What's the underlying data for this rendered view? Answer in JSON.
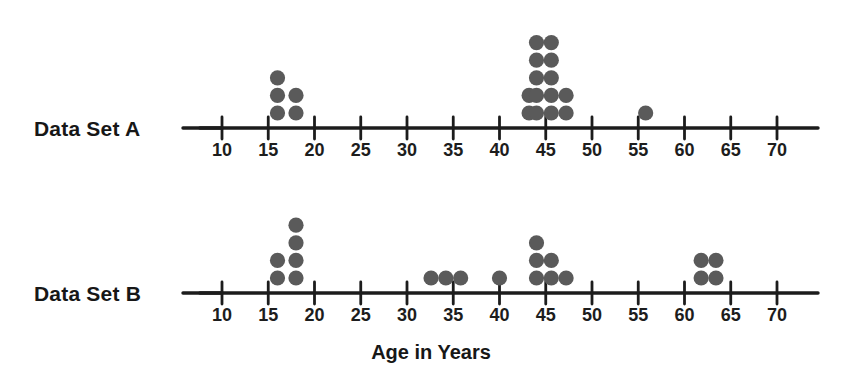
{
  "figure": {
    "axis_title": "Age in Years",
    "dot_color": "#5a5a5a",
    "axis_color": "#1c1c1c"
  },
  "plots": [
    {
      "id": "data-set-a",
      "label": "Data Set A",
      "baseline_y": 128,
      "ticks": [
        10,
        15,
        20,
        25,
        30,
        35,
        40,
        45,
        50,
        55,
        60,
        65,
        70
      ],
      "tick_label_y": 156,
      "lead_line_x1": 183,
      "lead_line_x2": 222,
      "axis_x1": 200,
      "axis_x2": 818,
      "stacks": [
        {
          "value": 16.0,
          "count": 3
        },
        {
          "value": 18.0,
          "count": 2
        },
        {
          "value": 43.2,
          "count": 2
        },
        {
          "value": 44.0,
          "count": 5
        },
        {
          "value": 45.6,
          "count": 5
        },
        {
          "value": 47.2,
          "count": 2
        },
        {
          "value": 55.8,
          "count": 1
        }
      ]
    },
    {
      "id": "data-set-b",
      "label": "Data Set B",
      "baseline_y": 293,
      "ticks": [
        10,
        15,
        20,
        25,
        30,
        35,
        40,
        45,
        50,
        55,
        60,
        65,
        70
      ],
      "tick_label_y": 321,
      "lead_line_x1": 183,
      "lead_line_x2": 222,
      "axis_x1": 200,
      "axis_x2": 818,
      "stacks": [
        {
          "value": 16.0,
          "count": 2
        },
        {
          "value": 18.0,
          "count": 4
        },
        {
          "value": 32.6,
          "count": 1
        },
        {
          "value": 34.2,
          "count": 1
        },
        {
          "value": 35.8,
          "count": 1
        },
        {
          "value": 40.0,
          "count": 1
        },
        {
          "value": 44.0,
          "count": 3
        },
        {
          "value": 45.6,
          "count": 2
        },
        {
          "value": 47.2,
          "count": 1
        },
        {
          "value": 61.8,
          "count": 2
        },
        {
          "value": 63.4,
          "count": 2
        }
      ]
    }
  ],
  "chart_data": {
    "type": "scatter",
    "title": "",
    "subtitle": "",
    "xlabel": "Age in Years",
    "ylabel": "",
    "xlim": [
      10,
      70
    ],
    "xticks": [
      10,
      15,
      20,
      25,
      30,
      35,
      40,
      45,
      50,
      55,
      60,
      65,
      70
    ],
    "grid": false,
    "legend_position": "none",
    "plot_style": "dot-plot",
    "series": [
      {
        "name": "Data Set A",
        "x": [
          16,
          16,
          16,
          18,
          18,
          43,
          43,
          44,
          44,
          44,
          44,
          44,
          45,
          45,
          45,
          45,
          45,
          47,
          47,
          56
        ],
        "stack_counts": [
          {
            "x": 16,
            "count": 3
          },
          {
            "x": 18,
            "count": 2
          },
          {
            "x": 43,
            "count": 2
          },
          {
            "x": 44,
            "count": 5
          },
          {
            "x": 45,
            "count": 5
          },
          {
            "x": 47,
            "count": 2
          },
          {
            "x": 56,
            "count": 1
          }
        ],
        "total": 20
      },
      {
        "name": "Data Set B",
        "x": [
          16,
          16,
          18,
          18,
          18,
          18,
          33,
          34,
          36,
          40,
          44,
          44,
          44,
          45,
          45,
          47,
          62,
          62,
          63,
          63
        ],
        "stack_counts": [
          {
            "x": 16,
            "count": 2
          },
          {
            "x": 18,
            "count": 4
          },
          {
            "x": 33,
            "count": 1
          },
          {
            "x": 34,
            "count": 1
          },
          {
            "x": 36,
            "count": 1
          },
          {
            "x": 40,
            "count": 1
          },
          {
            "x": 44,
            "count": 3
          },
          {
            "x": 45,
            "count": 2
          },
          {
            "x": 47,
            "count": 1
          },
          {
            "x": 62,
            "count": 2
          },
          {
            "x": 63,
            "count": 2
          }
        ],
        "total": 20
      }
    ]
  }
}
